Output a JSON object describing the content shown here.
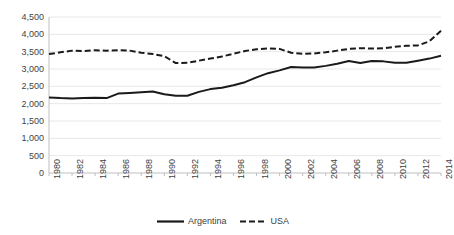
{
  "chart_data": {
    "type": "line",
    "title": "",
    "xlabel": "",
    "ylabel": "",
    "ylim": [
      0,
      4500
    ],
    "ytick_step": 500,
    "grid": "horizontal",
    "legend_position": "bottom",
    "x": [
      1980,
      1981,
      1982,
      1983,
      1984,
      1985,
      1986,
      1987,
      1988,
      1989,
      1990,
      1991,
      1992,
      1993,
      1994,
      1995,
      1996,
      1997,
      1998,
      1999,
      2000,
      2001,
      2002,
      2003,
      2004,
      2005,
      2006,
      2007,
      2008,
      2009,
      2010,
      2011,
      2012,
      2013,
      2014
    ],
    "ytick_labels": [
      "0",
      "500",
      "1,000",
      "1,500",
      "2,000",
      "2,500",
      "3,000",
      "3,500",
      "4,000",
      "4,500"
    ],
    "ytick_values": [
      0,
      500,
      1000,
      1500,
      2000,
      2500,
      3000,
      3500,
      4000,
      4500
    ],
    "xtick_labels": [
      "1980",
      "1982",
      "1984",
      "1986",
      "1988",
      "1990",
      "1992",
      "1994",
      "1996",
      "1998",
      "2000",
      "2002",
      "2004",
      "2006",
      "2008",
      "2010",
      "2012",
      "2014"
    ],
    "xtick_values": [
      1980,
      1982,
      1984,
      1986,
      1988,
      1990,
      1992,
      1994,
      1996,
      1998,
      2000,
      2002,
      2004,
      2006,
      2008,
      2010,
      2012,
      2014
    ],
    "series": [
      {
        "name": "Argentina",
        "style": "solid",
        "color": "#1a1a1a",
        "values": [
          2180,
          2160,
          2150,
          2160,
          2170,
          2160,
          2290,
          2310,
          2330,
          2350,
          2270,
          2230,
          2230,
          2340,
          2420,
          2460,
          2530,
          2620,
          2760,
          2880,
          2960,
          3060,
          3040,
          3040,
          3090,
          3150,
          3230,
          3170,
          3230,
          3220,
          3180,
          3180,
          3240,
          3300,
          3380
        ]
      },
      {
        "name": "USA",
        "style": "dashed",
        "color": "#1a1a1a",
        "values": [
          3430,
          3480,
          3530,
          3520,
          3540,
          3530,
          3540,
          3530,
          3470,
          3430,
          3370,
          3170,
          3180,
          3240,
          3300,
          3360,
          3440,
          3520,
          3570,
          3590,
          3580,
          3470,
          3440,
          3450,
          3480,
          3530,
          3580,
          3600,
          3590,
          3600,
          3640,
          3670,
          3680,
          3800,
          4100
        ]
      }
    ]
  },
  "legend": {
    "entries": [
      {
        "label": "Argentina",
        "style": "solid"
      },
      {
        "label": "USA",
        "style": "dashed"
      }
    ]
  },
  "axis_colors": {
    "grid": "#e8e8e8",
    "axis": "#bfbfbf",
    "text": "#3f3f3f",
    "line": "#1a1a1a"
  }
}
